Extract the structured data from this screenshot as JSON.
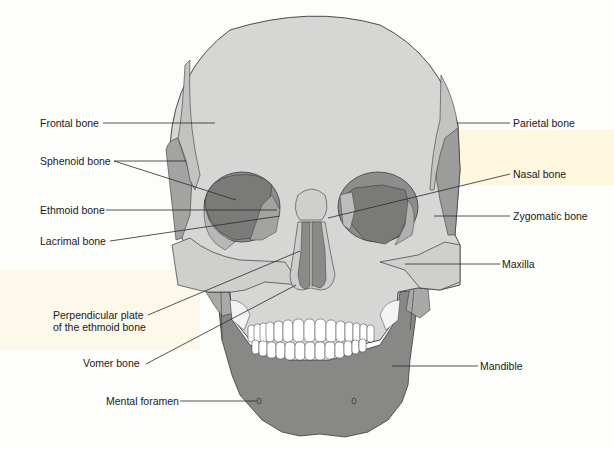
{
  "figure": {
    "colors": {
      "light_bone": "#d7d7d6",
      "mid_bone": "#b5b5b4",
      "dark_bone": "#8a8a89",
      "darker_bone": "#7c7c7b",
      "teeth": "#ffffff",
      "outline": "#3a3a3a",
      "leader_line": "#2a2a2a",
      "background": "#fdfdfb",
      "paper_highlight": "#fbf3d2"
    }
  },
  "labels": {
    "frontal": "Frontal bone",
    "sphenoid": "Sphenoid bone",
    "ethmoid": "Ethmoid bone",
    "lacrimal": "Lacrimal bone",
    "perpendicular_line1": "Perpendicular plate",
    "perpendicular_line2": "of the ethmoid bone",
    "vomer": "Vomer bone",
    "mental_foramen": "Mental foramen",
    "parietal": "Parietal bone",
    "nasal": "Nasal bone",
    "zygomatic": "Zygomatic bone",
    "maxilla": "Maxilla",
    "mandible": "Mandible"
  }
}
